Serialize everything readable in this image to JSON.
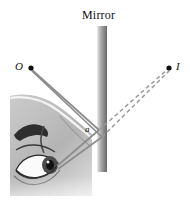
{
  "figure": {
    "title": "Mirror",
    "type": "optics-ray-diagram",
    "background_color": "#ffffff"
  },
  "labels": {
    "mirror": "Mirror",
    "object_point": "O",
    "image_point": "I",
    "angle": "a"
  },
  "colors": {
    "ray_line": "#8c8c8c",
    "dashed_line": "#9a9a9a",
    "point_dot": "#111111",
    "mirror_light": "#e6e6e6",
    "mirror_dark": "#6f6f6f",
    "face_fill": "#b9b9b9",
    "text": "#101010"
  },
  "geometry": {
    "mirror": {
      "x": 97,
      "y_top": 26,
      "y_bottom": 172,
      "width": 10
    },
    "object_dot": {
      "x": 31,
      "y": 68,
      "r": 2.6
    },
    "image_dot": {
      "x": 169,
      "y": 68,
      "r": 2.6
    },
    "reflection_point": {
      "x": 99,
      "y": 131
    },
    "eye_point": {
      "x": 57,
      "y": 167
    },
    "incident_rays": [
      {
        "x1": 31,
        "y1": 69,
        "x2": 99,
        "y2": 130
      },
      {
        "x1": 32,
        "y1": 71,
        "x2": 102,
        "y2": 137
      }
    ],
    "reflected_rays": [
      {
        "x1": 99,
        "y1": 130,
        "x2": 57,
        "y2": 166
      },
      {
        "x1": 102,
        "y1": 137,
        "x2": 58,
        "y2": 169
      }
    ],
    "virtual_dashed_rays": [
      {
        "x1": 99,
        "y1": 130,
        "x2": 168,
        "y2": 69
      },
      {
        "x1": 102,
        "y1": 137,
        "x2": 169,
        "y2": 71
      }
    ],
    "face_illustration": {
      "x": 4,
      "y": 92,
      "width": 88,
      "height": 104
    }
  }
}
